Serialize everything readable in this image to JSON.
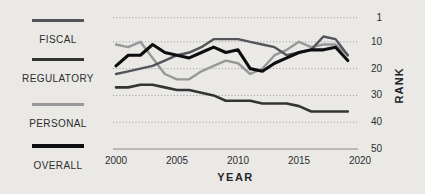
{
  "colors": {
    "background": "#eae9e6",
    "text": "#2d2d2f",
    "grid_dotted": "#98989a",
    "baseline": "#8a8a88"
  },
  "legend": {
    "items": [
      {
        "label": "FISCAL",
        "color": "#54545a",
        "thick": false
      },
      {
        "label": "REGULATORY",
        "color": "#343437",
        "thick": false
      },
      {
        "label": "PERSONAL",
        "color": "#98989a",
        "thick": false
      },
      {
        "label": "OVERALL",
        "color": "#0e0e10",
        "thick": true
      }
    ]
  },
  "chart_data": {
    "type": "line",
    "title": "",
    "xlabel": "YEAR",
    "ylabel": "RANK",
    "x_ticks": [
      2000,
      2005,
      2010,
      2015,
      2020
    ],
    "y_ticks": [
      1,
      10,
      20,
      30,
      40,
      50
    ],
    "xlim": [
      2000,
      2020
    ],
    "ylim": [
      1,
      50
    ],
    "y_axis_inverted": true,
    "grid": "dotted-horizontal",
    "x": [
      2000,
      2001,
      2002,
      2003,
      2004,
      2005,
      2006,
      2007,
      2008,
      2009,
      2010,
      2011,
      2012,
      2013,
      2014,
      2015,
      2016,
      2017,
      2018,
      2019
    ],
    "series": [
      {
        "name": "FISCAL",
        "color": "#54545a",
        "width": 2.4,
        "values": [
          22,
          21,
          20,
          19,
          17,
          15,
          14,
          12,
          9,
          9,
          9,
          10,
          11,
          12,
          15,
          14,
          13,
          8,
          9,
          15
        ]
      },
      {
        "name": "REGULATORY",
        "color": "#343437",
        "width": 2.6,
        "values": [
          27,
          27,
          26,
          26,
          27,
          28,
          28,
          29,
          30,
          32,
          32,
          32,
          33,
          33,
          33,
          34,
          36,
          36,
          36,
          36
        ]
      },
      {
        "name": "PERSONAL",
        "color": "#98989a",
        "width": 2.4,
        "values": [
          11,
          12,
          10,
          16,
          22,
          24,
          24,
          21,
          19,
          17,
          18,
          22,
          20,
          15,
          13,
          10,
          12,
          11,
          11,
          15
        ]
      },
      {
        "name": "OVERALL",
        "color": "#0e0e10",
        "width": 3.1,
        "values": [
          19,
          15,
          15,
          11,
          14,
          15,
          16,
          14,
          12,
          14,
          13,
          20,
          21,
          18,
          16,
          14,
          13,
          13,
          12,
          17
        ]
      }
    ]
  },
  "layout": {
    "plot": {
      "x_left": 113,
      "x_right": 358,
      "y_rank1": 17.7,
      "px_per_rank": 2.68,
      "x_year2000": 116,
      "px_per_year": 12.2
    }
  }
}
